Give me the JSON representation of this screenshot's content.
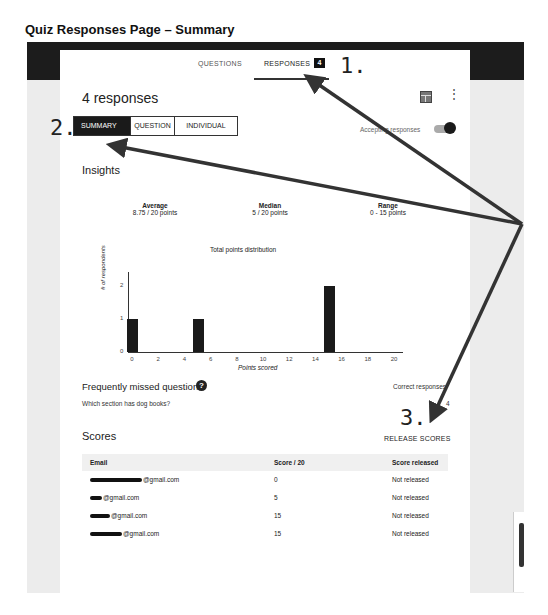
{
  "document": {
    "title": "Quiz Responses Page – Summary"
  },
  "tabs": [
    {
      "label": "QUESTIONS",
      "active": false
    },
    {
      "label": "RESPONSES",
      "active": true,
      "badge": "4"
    }
  ],
  "header": {
    "title": "4 responses",
    "sheet_icon": "spreadsheet-icon",
    "more_icon": "more-vert-icon",
    "more_glyph": "⋮"
  },
  "view_toggle": [
    {
      "label": "SUMMARY",
      "active": true
    },
    {
      "label": "QUESTION",
      "active": false
    },
    {
      "label": "INDIVIDUAL",
      "active": false
    }
  ],
  "accepting": {
    "label": "Accepting responses",
    "on": true
  },
  "insights": {
    "title": "Insights",
    "stats": [
      {
        "label": "Average",
        "value": "8.75 / 20 points"
      },
      {
        "label": "Median",
        "value": "5 / 20 points"
      },
      {
        "label": "Range",
        "value": "0 - 15 points"
      }
    ]
  },
  "chart_data": {
    "type": "bar",
    "title": "Total points distribution",
    "xlabel": "Points scored",
    "ylabel": "# of respondents",
    "x": [
      0,
      5,
      15
    ],
    "values": [
      1,
      1,
      2
    ],
    "xticks": [
      "0",
      "2",
      "4",
      "6",
      "8",
      "10",
      "12",
      "14",
      "16",
      "18",
      "20"
    ],
    "yticks": [
      "0",
      "1",
      "2"
    ],
    "xlim": [
      0,
      20
    ],
    "ylim": [
      0,
      2
    ],
    "grid": false
  },
  "missed": {
    "title": "Frequently missed questions",
    "help_glyph": "?",
    "question": "Which section has dog books?",
    "correct_label": "Correct responses",
    "correct_value": "4"
  },
  "scores": {
    "title": "Scores",
    "release_label": "RELEASE SCORES",
    "columns": [
      "Email",
      "Score / 20",
      "Score released"
    ],
    "rows": [
      {
        "email": "@gmail.com",
        "score": "0",
        "released": "Not released"
      },
      {
        "email": "@gmail.com",
        "score": "5",
        "released": "Not released"
      },
      {
        "email": "@gmail.com",
        "score": "15",
        "released": "Not released"
      },
      {
        "email": "@gmail.com",
        "score": "15",
        "released": "Not released"
      }
    ]
  },
  "callouts": [
    "1.",
    "2.",
    "3."
  ]
}
